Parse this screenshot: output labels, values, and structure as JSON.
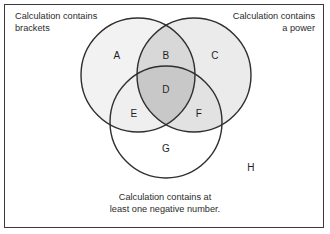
{
  "diagram": {
    "type": "venn-3-set",
    "border_color": "#3a3a3a",
    "background": "#ffffff",
    "stroke_color": "#2f2f2f"
  },
  "captions": {
    "top_left": "Calculation contains\nbrackets",
    "top_right": "Calculation contains\na power",
    "bottom": "Calculation contains at\nleast one negative number."
  },
  "sets": [
    {
      "id": "brackets",
      "label": "Calculation contains brackets",
      "cx": 138,
      "cy": 75,
      "r": 57
    },
    {
      "id": "power",
      "label": "Calculation contains a power",
      "cx": 194,
      "cy": 75,
      "r": 57
    },
    {
      "id": "negative",
      "label": "Calculation contains at least one negative number.",
      "cx": 166,
      "cy": 122,
      "r": 56
    }
  ],
  "regions": [
    {
      "id": "A",
      "letter": "A",
      "x": 117,
      "y": 55,
      "fill": "#f2f2f2",
      "desc": "brackets only"
    },
    {
      "id": "B",
      "letter": "B",
      "x": 166,
      "y": 55,
      "fill": "#d8d8d8",
      "desc": "brackets and power"
    },
    {
      "id": "C",
      "letter": "C",
      "x": 215,
      "y": 55,
      "fill": "#ebebeb",
      "desc": "power only"
    },
    {
      "id": "D",
      "letter": "D",
      "x": 166,
      "y": 89,
      "fill": "#c8c8c8",
      "desc": "all three sets"
    },
    {
      "id": "E",
      "letter": "E",
      "x": 134,
      "y": 113,
      "fill": "#efefef",
      "desc": "brackets and negative"
    },
    {
      "id": "F",
      "letter": "F",
      "x": 199,
      "y": 113,
      "fill": "#e2e2e2",
      "desc": "power and negative"
    },
    {
      "id": "G",
      "letter": "G",
      "x": 166,
      "y": 148,
      "fill": "#ffffff",
      "desc": "negative only"
    },
    {
      "id": "H",
      "letter": "H",
      "x": 251,
      "y": 167,
      "fill": "#ffffff",
      "desc": "outside all sets (universal set)"
    }
  ]
}
